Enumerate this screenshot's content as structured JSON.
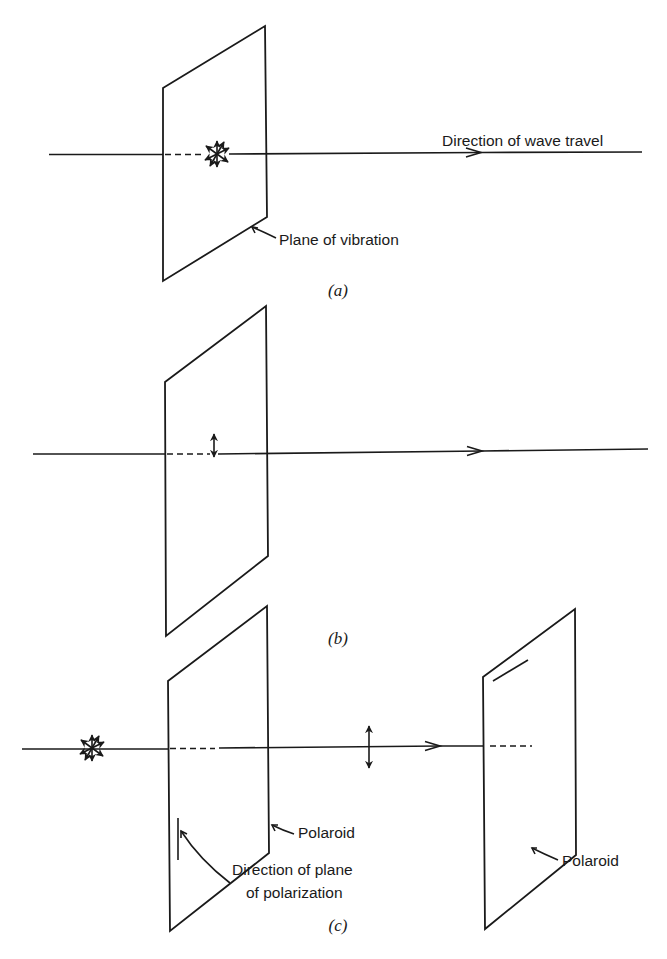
{
  "figure": {
    "panels": [
      {
        "id": "a",
        "caption": "(a)",
        "labels": {
          "direction": "Direction of wave travel",
          "plane": "Plane of vibration"
        },
        "polarization": "unpolarized"
      },
      {
        "id": "b",
        "caption": "(b)",
        "polarization": "plane-polarized (vertical)"
      },
      {
        "id": "c",
        "caption": "(c)",
        "labels": {
          "polaroid_1": "Polaroid",
          "polaroid_2": "Polaroid",
          "direction_line1": "Direction of plane",
          "direction_line2": "of polarization"
        },
        "polarization": "unpolarized → vertical after first polaroid"
      }
    ],
    "colors": {
      "ink": "#1a1a1a",
      "background": "#ffffff"
    }
  }
}
